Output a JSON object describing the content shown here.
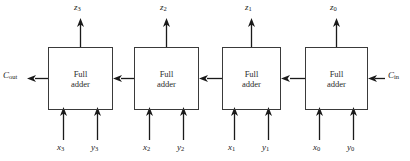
{
  "diagram": {
    "box_label_line1": "Full",
    "box_label_line2": "adder",
    "stroke_color": "#3a3a3a",
    "text_color": "#1a1a1a",
    "background": "#ffffff"
  },
  "blocks": [
    {
      "name": "full-adder-3",
      "label_line1": "Full",
      "label_line2": "adder"
    },
    {
      "name": "full-adder-2",
      "label_line1": "Full",
      "label_line2": "adder"
    },
    {
      "name": "full-adder-1",
      "label_line1": "Full",
      "label_line2": "adder"
    },
    {
      "name": "full-adder-0",
      "label_line1": "Full",
      "label_line2": "adder"
    }
  ],
  "outputs": [
    {
      "base": "z",
      "index": "3"
    },
    {
      "base": "z",
      "index": "2"
    },
    {
      "base": "z",
      "index": "1"
    },
    {
      "base": "z",
      "index": "0"
    }
  ],
  "inputs": [
    {
      "x_base": "x",
      "x_index": "3",
      "y_base": "y",
      "y_index": "3"
    },
    {
      "x_base": "x",
      "x_index": "2",
      "y_base": "y",
      "y_index": "2"
    },
    {
      "x_base": "x",
      "x_index": "1",
      "y_base": "y",
      "y_index": "1"
    },
    {
      "x_base": "x",
      "x_index": "0",
      "y_base": "y",
      "y_index": "0"
    }
  ],
  "carry": {
    "out_base": "C",
    "out_index": "out",
    "in_base": "C",
    "in_index": "in"
  }
}
